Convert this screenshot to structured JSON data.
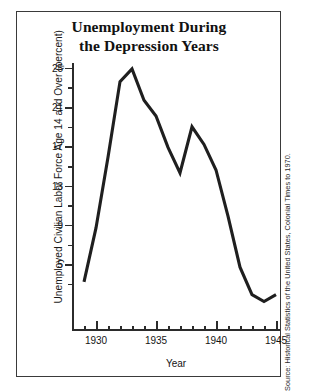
{
  "figure": {
    "title_line1": "Unemployment During",
    "title_line2": "the Depression Years",
    "source_note": "Source: Historical Statistics of the United States, Colonial Times to 1970.",
    "frame_color": "#3a3a3a",
    "line_color": "#1f1f1f"
  },
  "chart_data": {
    "type": "line",
    "title": "Unemployment During the Depression Years",
    "xlabel": "Year",
    "ylabel": "Unemployed Civilian Labor Force Age 14 and Over (percent)",
    "xlim": [
      1929,
      1945
    ],
    "ylim": [
      -1.8,
      25.8
    ],
    "grid": false,
    "legend": "none",
    "x_major_ticks": [
      1930,
      1935,
      1940,
      1945
    ],
    "x_tick_labels": [
      "1930",
      "1935",
      "1940",
      "1945"
    ],
    "x_minor_ticks": [
      1929,
      1931,
      1932,
      1933,
      1934,
      1936,
      1937,
      1938,
      1939,
      1941,
      1942,
      1943,
      1944
    ],
    "y_major_ticks": [
      5,
      9,
      13,
      17,
      21,
      25
    ],
    "y_tick_labels": [
      "5",
      "9",
      "13",
      "17",
      "21",
      "25"
    ],
    "y_minor_ticks": [
      3,
      7,
      11,
      15,
      19,
      23
    ],
    "x": [
      1929,
      1930,
      1931,
      1932,
      1933,
      1934,
      1935,
      1936,
      1937,
      1938,
      1939,
      1940,
      1941,
      1942,
      1943,
      1944,
      1945
    ],
    "values": [
      3.2,
      8.7,
      15.9,
      23.6,
      24.9,
      21.7,
      20.1,
      16.9,
      14.3,
      19.0,
      17.2,
      14.6,
      9.9,
      4.7,
      1.9,
      1.2,
      1.9
    ],
    "series": [
      {
        "name": "Unemployment rate",
        "values": [
          3.2,
          8.7,
          15.9,
          23.6,
          24.9,
          21.7,
          20.1,
          16.9,
          14.3,
          19.0,
          17.2,
          14.6,
          9.9,
          4.7,
          1.9,
          1.2,
          1.9
        ]
      }
    ]
  }
}
